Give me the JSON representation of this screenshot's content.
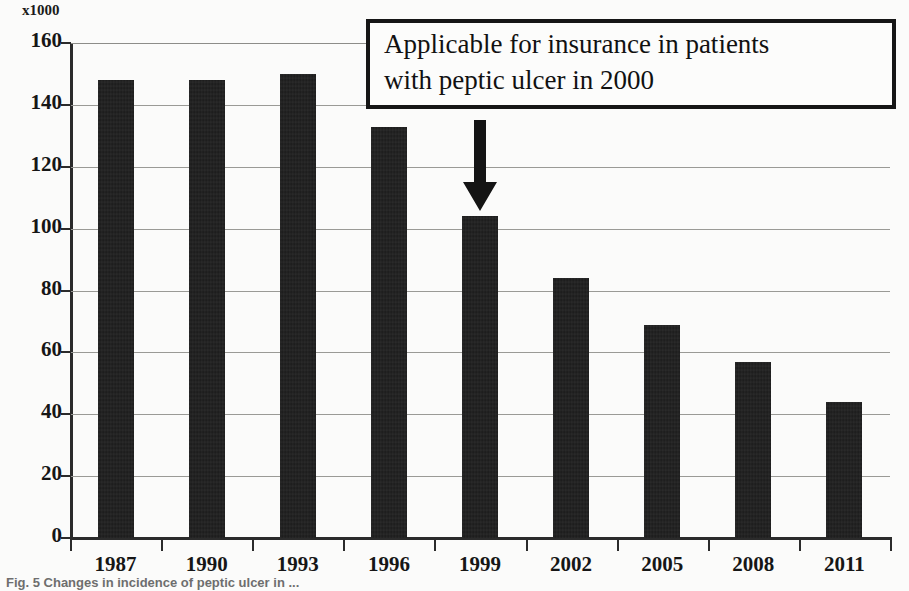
{
  "figure": {
    "unit_label": "x1000",
    "caption": "Fig. 5   Changes in incidence of peptic ulcer in ..."
  },
  "annotation": {
    "line1": "Applicable for insurance in patients",
    "line2": "with peptic ulcer in 2000",
    "arrow_target_category": "1999",
    "arrow_icon": "arrow-down-icon"
  },
  "colors": {
    "bar": "#1a1a1a",
    "axis": "#2b2b2b",
    "gridline": "#9a9a96",
    "text": "#161616",
    "background": "#fbfbfa"
  },
  "chart_data": {
    "type": "bar",
    "title": "",
    "xlabel": "",
    "ylabel": "x1000",
    "ylim": [
      0,
      160
    ],
    "yticks": [
      0,
      20,
      40,
      60,
      80,
      100,
      120,
      140,
      160
    ],
    "ytick_labels": [
      "0",
      "20",
      "40",
      "60",
      "80",
      "100",
      "120",
      "140",
      "160"
    ],
    "grid": true,
    "legend": false,
    "categories": [
      "1987",
      "1990",
      "1993",
      "1996",
      "1999",
      "2002",
      "2005",
      "2008",
      "2011"
    ],
    "values": [
      148,
      148,
      150,
      133,
      104,
      84,
      69,
      57,
      44
    ],
    "annotations": [
      {
        "text": "Applicable for insurance in patients with peptic ulcer in 2000",
        "points_to": "1999",
        "style": "boxed-with-down-arrow"
      }
    ]
  }
}
